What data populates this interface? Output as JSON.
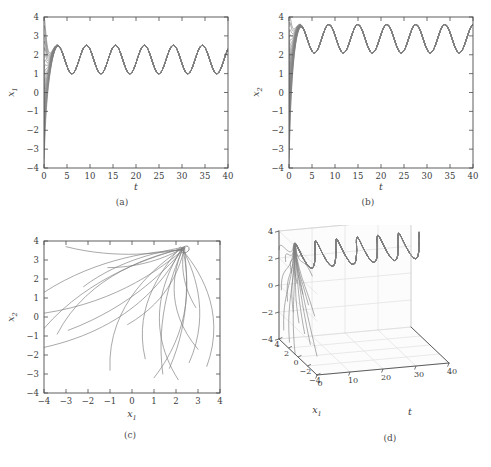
{
  "figure": {
    "background": "#ffffff",
    "line_color": "#808080",
    "axis_color": "#4d4d4d",
    "grid_color": "#d0d0d0"
  },
  "panels": [
    {
      "id": "a",
      "caption": "(a)",
      "xlabel": "t",
      "ylabel": "x",
      "ylabel_sub": "1",
      "xticks": [
        "0",
        "5",
        "10",
        "15",
        "20",
        "25",
        "30",
        "35",
        "40"
      ],
      "yticks": [
        "-4",
        "-3",
        "-2",
        "-1",
        "0",
        "1",
        "2",
        "3",
        "4"
      ]
    },
    {
      "id": "b",
      "caption": "(b)",
      "xlabel": "t",
      "ylabel": "x",
      "ylabel_sub": "2",
      "xticks": [
        "0",
        "5",
        "10",
        "15",
        "20",
        "25",
        "30",
        "35",
        "40"
      ],
      "yticks": [
        "-4",
        "-3",
        "-2",
        "-1",
        "0",
        "1",
        "2",
        "3",
        "4"
      ]
    },
    {
      "id": "c",
      "caption": "(c)",
      "xlabel": "x",
      "xlabel_sub": "1",
      "ylabel": "x",
      "ylabel_sub": "2",
      "xticks": [
        "-4",
        "-3",
        "-2",
        "-1",
        "0",
        "1",
        "2",
        "3",
        "4"
      ],
      "yticks": [
        "-4",
        "-3",
        "-2",
        "-1",
        "0",
        "1",
        "2",
        "3",
        "4"
      ]
    },
    {
      "id": "d",
      "caption": "(d)",
      "xlabel": "x",
      "xlabel_sub": "1",
      "ylabel": "t",
      "zlabel": "x",
      "zlabel_sub": "2",
      "xticks": [
        "4",
        "2",
        "0",
        "-2",
        "-4"
      ],
      "yticks": [
        "0",
        "10",
        "20",
        "30",
        "40"
      ],
      "zticks": [
        "-4",
        "-2",
        "0",
        "2",
        "4"
      ]
    }
  ],
  "chart_data": [
    {
      "type": "line",
      "panel": "a",
      "title": "(a)",
      "xlabel": "t",
      "ylabel": "x_1",
      "xlim": [
        0,
        40
      ],
      "ylim": [
        -4,
        4
      ],
      "xticks": [
        0,
        5,
        10,
        15,
        20,
        25,
        30,
        35,
        40
      ],
      "yticks": [
        -4,
        -3,
        -2,
        -1,
        0,
        1,
        2,
        3,
        4
      ],
      "grid": false,
      "description": "Twenty trajectories of x1 versus time starting from initial conditions spread across -4 to 4 at t=0; all converge within about t=3 onto a common periodic limit cycle.",
      "steady_state": {
        "mean": 1.75,
        "amplitude": 0.75,
        "min": 1.0,
        "max": 2.5,
        "period": 6.3,
        "waveform": "sinusoidal"
      },
      "initial_conditions": [
        -4,
        -3.5,
        -3,
        -2.6,
        -2.2,
        -1.8,
        -1.4,
        -1,
        -0.6,
        -0.2,
        0.2,
        0.6,
        1,
        1.4,
        1.8,
        2.2,
        2.6,
        3,
        3.5,
        4
      ],
      "transient_peak": 2.6,
      "transient_peak_time": 1.5,
      "n_trajectories": 20
    },
    {
      "type": "line",
      "panel": "b",
      "title": "(b)",
      "xlabel": "t",
      "ylabel": "x_2",
      "xlim": [
        0,
        40
      ],
      "ylim": [
        -4,
        4
      ],
      "xticks": [
        0,
        5,
        10,
        15,
        20,
        25,
        30,
        35,
        40
      ],
      "yticks": [
        -4,
        -3,
        -2,
        -1,
        0,
        1,
        2,
        3,
        4
      ],
      "grid": false,
      "description": "Twenty trajectories of x2 versus time; all rise rapidly from initial conditions between -4 and 4 and settle by about t=4 onto a periodic orbit oscillating between 2.1 and 3.6.",
      "steady_state": {
        "mean": 2.85,
        "amplitude": 0.75,
        "min": 2.1,
        "max": 3.6,
        "period": 6.3,
        "waveform": "sinusoidal"
      },
      "initial_conditions": [
        -4,
        -3.5,
        -3,
        -2.6,
        -2.2,
        -1.8,
        -1.4,
        -1,
        -0.6,
        -0.2,
        0.2,
        0.6,
        1,
        1.4,
        1.8,
        2.2,
        2.6,
        3,
        3.5,
        4
      ],
      "transient_peak": 3.85,
      "transient_peak_time": 1.2,
      "n_trajectories": 20
    },
    {
      "type": "line",
      "panel": "c",
      "title": "(c)",
      "xlabel": "x_1",
      "ylabel": "x_2",
      "xlim": [
        -4,
        4
      ],
      "ylim": [
        -4,
        4
      ],
      "xticks": [
        -4,
        -3,
        -2,
        -1,
        0,
        1,
        2,
        3,
        4
      ],
      "yticks": [
        -4,
        -3,
        -2,
        -1,
        0,
        1,
        2,
        3,
        4
      ],
      "grid": false,
      "description": "Phase-plane portrait: twenty trajectories spread over the square converge to a small limit cycle located near x1=2.3, x2=3.6 in the upper right.",
      "attractor": {
        "x1": 2.3,
        "x2": 3.6
      },
      "trajectory_starts": [
        [
          -3.0,
          3.7
        ],
        [
          -4.0,
          1.3
        ],
        [
          -4.0,
          0.2
        ],
        [
          -4.0,
          -0.6
        ],
        [
          -4.0,
          -1.6
        ],
        [
          -3.4,
          -0.9
        ],
        [
          -2.9,
          -0.7
        ],
        [
          -2.2,
          1.6
        ],
        [
          -1.1,
          2.6
        ],
        [
          -1.0,
          -2.8
        ],
        [
          -0.2,
          -0.4
        ],
        [
          0.6,
          -2.2
        ],
        [
          1.0,
          -3.2
        ],
        [
          1.4,
          -3.0
        ],
        [
          1.7,
          -2.7
        ],
        [
          2.1,
          -3.3
        ],
        [
          2.6,
          -2.4
        ],
        [
          3.0,
          -1.7
        ],
        [
          3.4,
          -2.6
        ],
        [
          2.9,
          0.5
        ]
      ],
      "n_trajectories": 20
    },
    {
      "type": "line",
      "panel": "d",
      "title": "(d)",
      "xlabel": "x_1",
      "ylabel": "t",
      "zlabel": "x_2",
      "xlim": [
        -4,
        4
      ],
      "ylim": [
        0,
        40
      ],
      "zlim": [
        -4,
        4
      ],
      "xticks": [
        4,
        2,
        0,
        -2,
        -4
      ],
      "yticks": [
        0,
        10,
        20,
        30,
        40
      ],
      "zticks": [
        -4,
        -2,
        0,
        2,
        4
      ],
      "grid": true,
      "projection": "3d",
      "description": "Three-dimensional view of the same twenty trajectories in (x1, t, x2) space; the bundle of curves collapses onto a single oscillating tube that extends along the time axis to t=40.",
      "n_trajectories": 20
    }
  ]
}
